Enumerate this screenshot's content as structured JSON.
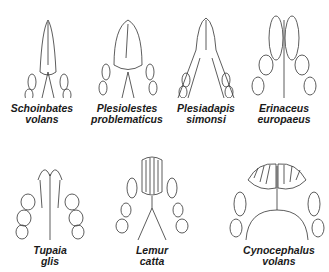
{
  "figure": {
    "panels": [
      {
        "id": "schoinbates",
        "genus": "Schoinbates",
        "species": "volans"
      },
      {
        "id": "plesiolestes",
        "genus": "Plesiolestes",
        "species": "problematicus"
      },
      {
        "id": "plesiadapis",
        "genus": "Plesiadapis",
        "species": "simonsi"
      },
      {
        "id": "erinaceus",
        "genus": "Erinaceus",
        "species": "europaeus"
      },
      {
        "id": "tupaia",
        "genus": "Tupaia",
        "species": "glis"
      },
      {
        "id": "lemur",
        "genus": "Lemur",
        "species": "catta"
      },
      {
        "id": "cynocephalus",
        "genus": "Cynocephalus",
        "species": "volans"
      }
    ]
  }
}
